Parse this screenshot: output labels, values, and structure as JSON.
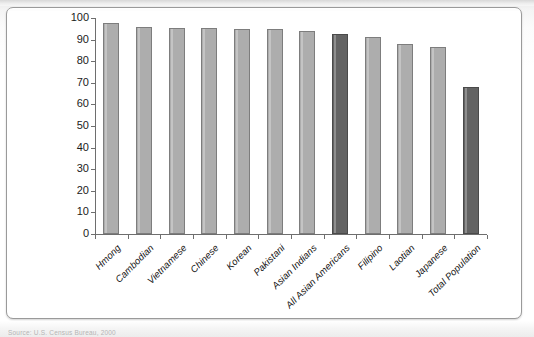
{
  "figure": {
    "source_note": "Source: U.S. Census Bureau, 2000",
    "scan_artifact_top": ""
  },
  "chart_data": {
    "type": "bar",
    "title": "",
    "subtitle": "",
    "xlabel": "",
    "ylabel": "",
    "ylim": [
      0,
      100
    ],
    "ytick_labels": [
      "100",
      "90",
      "80",
      "70",
      "60",
      "50",
      "40",
      "30",
      "20",
      "10",
      "0"
    ],
    "ytick_values": [
      100,
      90,
      80,
      70,
      60,
      50,
      40,
      30,
      20,
      10,
      0
    ],
    "grid": false,
    "legend": "none",
    "categories": [
      "Hmong",
      "Cambodian",
      "Vietnamese",
      "Chinese",
      "Korean",
      "Pakistani",
      "Asian Indians",
      "All Asian Americans",
      "Filipino",
      "Laotian",
      "Japanese",
      "Total Population"
    ],
    "values": [
      97.5,
      96.0,
      95.5,
      95.3,
      95.0,
      94.8,
      94.0,
      92.8,
      91.0,
      88.0,
      86.5,
      68.0
    ],
    "bar_styles": [
      "light",
      "light",
      "light",
      "light",
      "light",
      "light",
      "light",
      "dark",
      "light",
      "light",
      "light",
      "dark"
    ],
    "colors": {
      "bar_light": "#adadad",
      "bar_dark": "#636363",
      "axis": "#6e6e6e",
      "text": "#111111",
      "card_background": "#ffffff",
      "card_border": "#9a9a9a"
    }
  }
}
